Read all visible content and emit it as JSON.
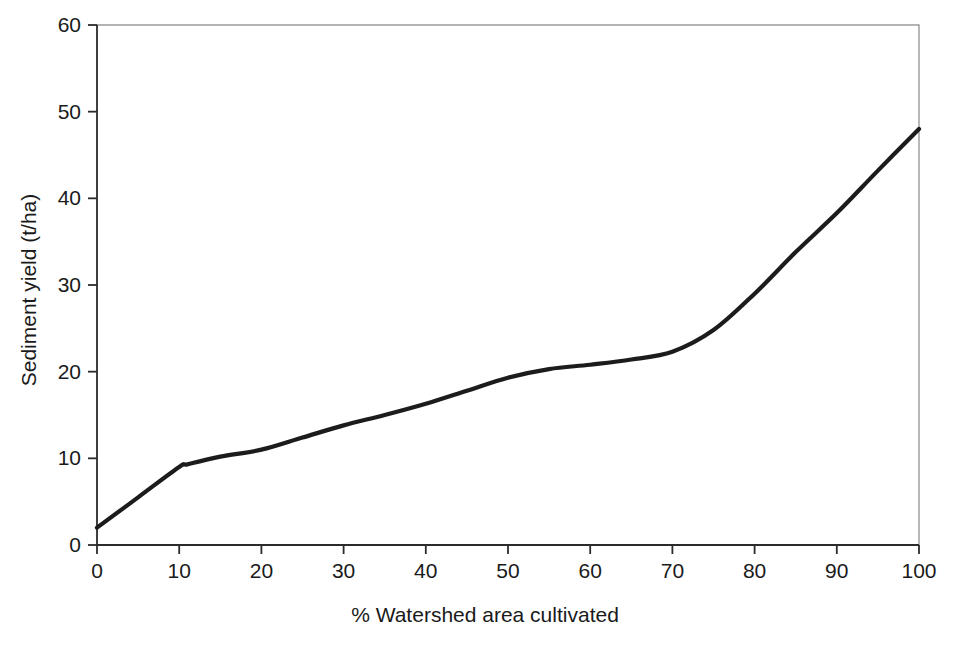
{
  "chart_data": {
    "type": "line",
    "title": "",
    "subtitle": "",
    "xlabel": "% Watershed area cultivated",
    "ylabel": "Sediment yield (t/ha)",
    "xlim": [
      0,
      100
    ],
    "ylim": [
      0,
      60
    ],
    "xticks": [
      0,
      10,
      20,
      30,
      40,
      50,
      60,
      70,
      80,
      90,
      100
    ],
    "yticks": [
      0,
      10,
      20,
      30,
      40,
      50,
      60
    ],
    "xtick_labels": [
      "0",
      "10",
      "20",
      "30",
      "40",
      "50",
      "60",
      "70",
      "80",
      "90",
      "100"
    ],
    "ytick_labels": [
      "0",
      "10",
      "20",
      "30",
      "40",
      "50",
      "60"
    ],
    "grid": false,
    "legend": false,
    "legend_position": "none",
    "series": [
      {
        "name": "Sediment yield",
        "color": "#1c1c1c",
        "x": [
          0,
          5,
          10,
          11,
          15,
          20,
          25,
          30,
          35,
          40,
          45,
          50,
          55,
          60,
          65,
          70,
          75,
          80,
          85,
          90,
          95,
          100
        ],
        "values": [
          2.0,
          5.5,
          9.0,
          9.3,
          10.2,
          11.0,
          12.4,
          13.8,
          15.0,
          16.3,
          17.8,
          19.3,
          20.3,
          20.8,
          21.4,
          22.3,
          24.8,
          29.0,
          33.8,
          38.3,
          43.2,
          48.0
        ]
      }
    ],
    "annotations": []
  },
  "axes": {
    "x_axis_title": "% Watershed area cultivated",
    "y_axis_title": "Sediment yield (t/ha)"
  },
  "colors": {
    "curve": "#1c1c1c",
    "axis": "#2b2b2b",
    "frame": "#9a9a9a",
    "background": "#ffffff",
    "text": "#1a1a1a"
  }
}
